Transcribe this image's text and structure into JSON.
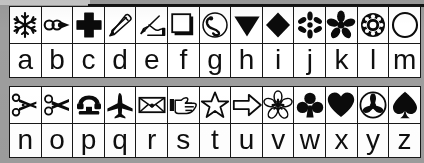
{
  "document": {
    "kind": "dingbat-character-map",
    "description": "Two-row symbol font reference chart mapping keyboard letters a-z to dingbat glyphs",
    "ink_color": "#0d0d0d",
    "paper_color": "#ffffff",
    "background_color": "#9d9d9d",
    "rule_color": "#1a1a1a"
  },
  "tables": [
    {
      "id": "upper",
      "columns": 13,
      "cells": [
        {
          "letter": "a",
          "icon": "snowflake-icon",
          "icon_label": "snowflake"
        },
        {
          "letter": "b",
          "icon": "looped-arrow-icon",
          "icon_label": "looped arrow"
        },
        {
          "letter": "c",
          "icon": "bold-cross-icon",
          "icon_label": "bold cross"
        },
        {
          "letter": "d",
          "icon": "pencil-icon",
          "icon_label": "pencil"
        },
        {
          "letter": "e",
          "icon": "writing-hand-icon",
          "icon_label": "writing hand with pen"
        },
        {
          "letter": "f",
          "icon": "outlined-square-icon",
          "icon_label": "outlined square"
        },
        {
          "letter": "g",
          "icon": "telephone-circle-icon",
          "icon_label": "telephone handset in circle"
        },
        {
          "letter": "h",
          "icon": "down-triangle-icon",
          "icon_label": "filled down triangle"
        },
        {
          "letter": "i",
          "icon": "diamond-icon",
          "icon_label": "filled diamond"
        },
        {
          "letter": "j",
          "icon": "six-point-asterisk-icon",
          "icon_label": "six point asterisk flower"
        },
        {
          "letter": "k",
          "icon": "petal-flower-icon",
          "icon_label": "five petal filled flower"
        },
        {
          "letter": "l",
          "icon": "rosette-icon",
          "icon_label": "ornate rosette"
        },
        {
          "letter": "m",
          "icon": "circle-outline-icon",
          "icon_label": "circle outline"
        }
      ]
    },
    {
      "id": "lower",
      "columns": 13,
      "cells": [
        {
          "letter": "n",
          "icon": "scissors-upper-icon",
          "icon_label": "scissors upper blade"
        },
        {
          "letter": "o",
          "icon": "scissors-lower-icon",
          "icon_label": "scissors lower blade"
        },
        {
          "letter": "p",
          "icon": "telephone-icon",
          "icon_label": "telephone"
        },
        {
          "letter": "q",
          "icon": "airplane-icon",
          "icon_label": "airplane"
        },
        {
          "letter": "r",
          "icon": "envelope-icon",
          "icon_label": "envelope"
        },
        {
          "letter": "s",
          "icon": "pointing-hand-icon",
          "icon_label": "pointing hand right"
        },
        {
          "letter": "t",
          "icon": "star-outline-icon",
          "icon_label": "outlined star"
        },
        {
          "letter": "u",
          "icon": "right-arrow-icon",
          "icon_label": "outlined right arrow"
        },
        {
          "letter": "v",
          "icon": "outline-flower-icon",
          "icon_label": "outlined flower"
        },
        {
          "letter": "w",
          "icon": "club-icon",
          "icon_label": "club suit"
        },
        {
          "letter": "x",
          "icon": "heart-icon",
          "icon_label": "heart suit"
        },
        {
          "letter": "y",
          "icon": "propeller-circle-icon",
          "icon_label": "three blade propeller in circle"
        },
        {
          "letter": "z",
          "icon": "spade-icon",
          "icon_label": "spade suit"
        }
      ]
    }
  ]
}
